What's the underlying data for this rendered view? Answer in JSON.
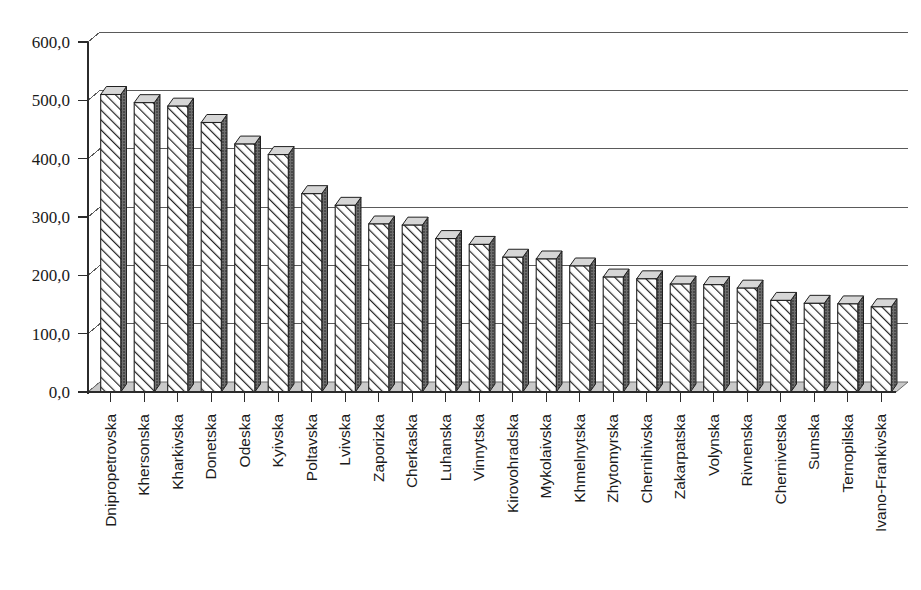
{
  "chart_data": {
    "type": "bar",
    "title": "",
    "subtitle": "",
    "xlabel": "",
    "ylabel": "",
    "ylim": [
      0,
      600
    ],
    "ytick_step": 100,
    "grid": true,
    "legend": "none",
    "decimal_separator": ",",
    "style": "3d-hatched-bars",
    "ytick_labels": [
      "0,0",
      "100,0",
      "200,0",
      "300,0",
      "400,0",
      "500,0",
      "600,0"
    ],
    "ytick_values": [
      0,
      100,
      200,
      300,
      400,
      500,
      600
    ],
    "categories": [
      "Dnipropetrovska",
      "Khersonska",
      "Kharkivska",
      "Donetska",
      "Odeska",
      "Kyivska",
      "Poltavska",
      "Lvivska",
      "Zaporizka",
      "Cherkaska",
      "Luhanska",
      "Vinnytska",
      "Kirovohradska",
      "Mykolaivska",
      "Khmelnytska",
      "Zhytomyrska",
      "Chernihivska",
      "Zakarpatska",
      "Volynska",
      "Rivnenska",
      "Chernivetska",
      "Sumska",
      "Ternopilska",
      "Ivano-Frankivska"
    ],
    "values": [
      510,
      496,
      490,
      462,
      425,
      407,
      340,
      320,
      288,
      286,
      263,
      253,
      231,
      228,
      216,
      197,
      194,
      185,
      184,
      178,
      157,
      152,
      151,
      146
    ]
  },
  "colors": {
    "bar_outline": "#1f1f1f",
    "bar_fill": "#ffffff",
    "bar_side": "#4a4a4a",
    "grid": "#5a5a5a",
    "axis": "#2b2b2b",
    "text": "#1a1a1a",
    "background": "#ffffff"
  }
}
